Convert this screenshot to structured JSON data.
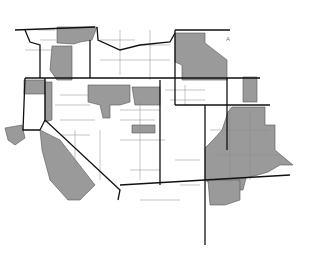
{
  "map": {
    "type": "choropleth-county-map",
    "region": "Western United States",
    "legend": null,
    "colors": {
      "background": "#ffffff",
      "highlighted_county": "#9a9a9a",
      "state_border": "#111111",
      "county_border": "#888888"
    },
    "annotations": [
      {
        "text": "A",
        "x": 226,
        "y": 40
      }
    ]
  }
}
